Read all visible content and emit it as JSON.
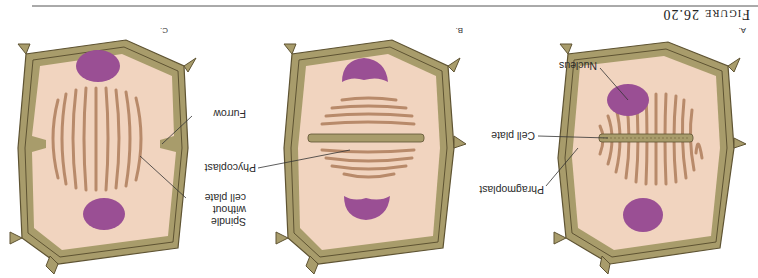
{
  "figure": {
    "title_prefix": "F",
    "title_smallcaps": "IGURE",
    "title_number": "26.20",
    "orientation": "rotated 180 degrees",
    "colors": {
      "cell_wall": "#a89c6b",
      "cell_wall_line": "#5e5332",
      "cytoplasm": "#f1d4bf",
      "nucleus": "#9a4f94",
      "fibers": "#b88a6a",
      "cell_plate": "#a89c6b"
    }
  },
  "panels": [
    {
      "id": "A",
      "label": "A.",
      "labels": {
        "nucleus": "Nucleus",
        "cell_plate": "Cell plate",
        "phragmoplast": "Phragmoplast"
      }
    },
    {
      "id": "B",
      "label": "B.",
      "labels": {
        "phycoplast": "Phycoplast"
      }
    },
    {
      "id": "C",
      "label": "C.",
      "labels": {
        "furrow": "Furrow",
        "spindle_line1": "Spindle",
        "spindle_line2": "without",
        "spindle_line3": "cell plate"
      }
    }
  ]
}
